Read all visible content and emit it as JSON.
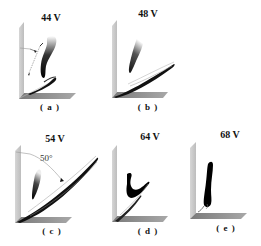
{
  "figure": {
    "panels": [
      {
        "id": "a",
        "title": "44 V",
        "label": "( a )"
      },
      {
        "id": "b",
        "title": "48 V",
        "label": "( b )"
      },
      {
        "id": "c",
        "title": "54 V",
        "label": "( c )",
        "annotation": "50°"
      },
      {
        "id": "d",
        "title": "64 V",
        "label": "( d )"
      },
      {
        "id": "e",
        "title": "68 V",
        "label": "( e )"
      }
    ]
  }
}
